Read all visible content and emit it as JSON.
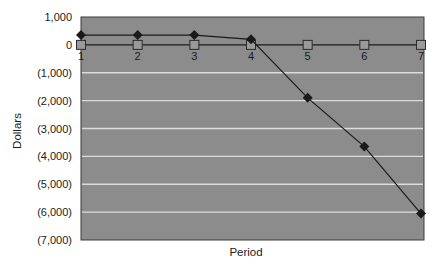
{
  "chart_data": {
    "type": "line",
    "title": "",
    "xlabel": "Period",
    "ylabel": "Dollars",
    "categories": [
      "1",
      "2",
      "3",
      "4",
      "5",
      "6",
      "7"
    ],
    "x": [
      1,
      2,
      3,
      4,
      5,
      6,
      7
    ],
    "series": [
      {
        "name": "Series 1 (diamond markers)",
        "marker": "diamond",
        "values": [
          350,
          350,
          350,
          200,
          -1900,
          -3650,
          -6050
        ]
      },
      {
        "name": "Series 2 (square markers)",
        "marker": "square",
        "values": [
          0,
          0,
          0,
          0,
          0,
          0,
          0
        ]
      }
    ],
    "ylim": [
      -7000,
      1000
    ],
    "yticks": [
      1000,
      0,
      -1000,
      -2000,
      -3000,
      -4000,
      -5000,
      -6000,
      -7000
    ],
    "ytick_labels": [
      "1,000",
      "0",
      "(1,000)",
      "(2,000)",
      "(3,000)",
      "(4,000)",
      "(5,000)",
      "(6,000)",
      "(7,000)"
    ],
    "grid": {
      "horizontal": true,
      "vertical": false
    },
    "legend": "none",
    "category_labels_position": "at zero line"
  },
  "colors": {
    "plot_background": "#8c8c8c",
    "gridline": "#dcdcdc",
    "plot_border": "#3a3a3a",
    "line": "#1a1a1a",
    "diamond_marker": "#1a1a1a",
    "square_marker_fill": "#9a9a9a",
    "square_marker_stroke": "#2a2a2a"
  }
}
